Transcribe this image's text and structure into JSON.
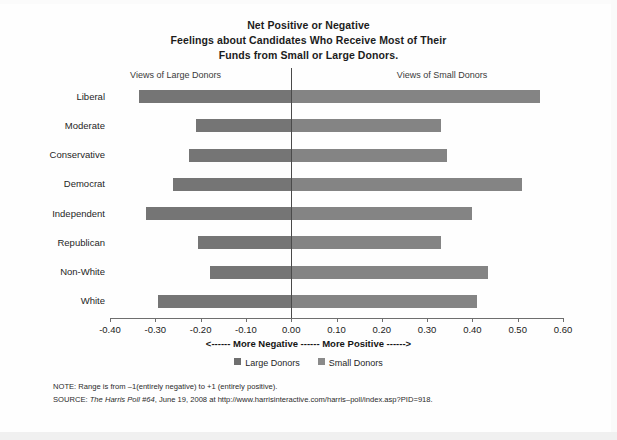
{
  "title": {
    "line1": "Net Positive or Negative",
    "line2": "Feelings about Candidates Who Receive Most of Their",
    "line3": "Funds from Small or Large Donors."
  },
  "headers": {
    "left": "Views of Large Donors",
    "right": "Views of Small Donors"
  },
  "axis": {
    "arrow_label": "<------ More Negative ------ More Positive ------>",
    "ticks": [
      "-0.40",
      "-0.30",
      "-0.20",
      "-0.10",
      "0.00",
      "0.10",
      "0.20",
      "0.30",
      "0.40",
      "0.50",
      "0.60"
    ]
  },
  "legend": {
    "items": [
      {
        "label": "Large Donors",
        "color": "#6f6f6f"
      },
      {
        "label": "Small Donors",
        "color": "#8a8a8a"
      }
    ]
  },
  "notes": {
    "note_prefix": "NOTE: Range is from –1(entirely negative) to +1 (entirely positive).",
    "source_prefix": "SOURCE: ",
    "source_italic": "The Harris Poll #64",
    "source_rest": ", June 19, 2008 at http://www.harrisinteractive.com/harris–poll/index.asp?PID=918."
  },
  "chart_data": {
    "type": "bar",
    "orientation": "horizontal",
    "title": "Net Positive or Negative Feelings about Candidates Who Receive Most of Their Funds from Small or Large Donors.",
    "xlabel": "<------ More Negative ------ More Positive ------>",
    "ylabel": "",
    "xlim": [
      -0.4,
      0.6
    ],
    "xticks": [
      -0.4,
      -0.3,
      -0.2,
      -0.1,
      0.0,
      0.1,
      0.2,
      0.3,
      0.4,
      0.5,
      0.6
    ],
    "grid": false,
    "legend_position": "bottom",
    "categories": [
      "Liberal",
      "Moderate",
      "Conservative",
      "Democrat",
      "Independent",
      "Republican",
      "Non-White",
      "White"
    ],
    "series": [
      {
        "name": "Large Donors",
        "color": "#757575",
        "values": [
          -0.335,
          -0.21,
          -0.225,
          -0.26,
          -0.32,
          -0.205,
          -0.18,
          -0.295
        ]
      },
      {
        "name": "Small Donors",
        "color": "#848484",
        "values": [
          0.55,
          0.33,
          0.345,
          0.51,
          0.4,
          0.33,
          0.435,
          0.41
        ]
      }
    ]
  }
}
